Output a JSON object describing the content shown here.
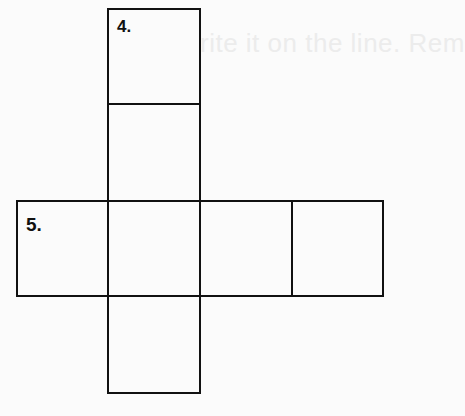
{
  "background_text": "rite it on the line. Rem",
  "net": {
    "labels": {
      "top": "4.",
      "left": "5."
    },
    "squares": [
      {
        "name": "top",
        "x": 107,
        "y": 8,
        "w": 94,
        "h": 97
      },
      {
        "name": "upper-middle",
        "x": 107,
        "y": 103,
        "w": 94,
        "h": 99
      },
      {
        "name": "left",
        "x": 16,
        "y": 200,
        "w": 93,
        "h": 97
      },
      {
        "name": "center",
        "x": 107,
        "y": 200,
        "w": 94,
        "h": 97
      },
      {
        "name": "right-1",
        "x": 199,
        "y": 200,
        "w": 94,
        "h": 97
      },
      {
        "name": "right-2",
        "x": 291,
        "y": 200,
        "w": 93,
        "h": 97
      },
      {
        "name": "bottom",
        "x": 107,
        "y": 295,
        "w": 94,
        "h": 99
      }
    ]
  }
}
